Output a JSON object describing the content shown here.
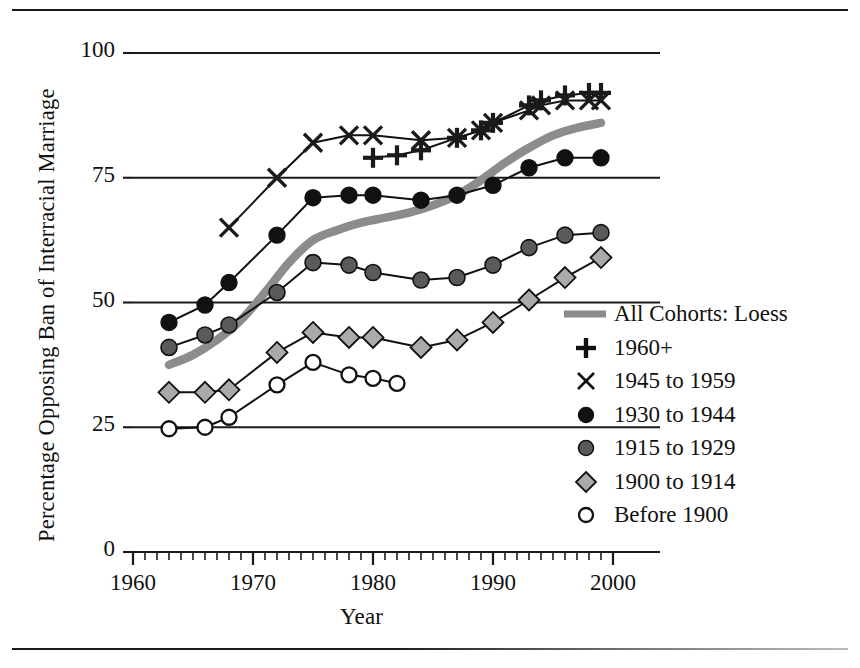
{
  "chart_data": {
    "type": "line",
    "title": "",
    "xlabel": "Year",
    "ylabel": "Percentage Opposing Ban of Interracial Marriage",
    "xlim": [
      1960,
      2000
    ],
    "ylim": [
      0,
      100
    ],
    "xticks": [
      1960,
      1970,
      1980,
      1990,
      2000
    ],
    "yticks": [
      0,
      25,
      50,
      75,
      100
    ],
    "xtick_labels": [
      "1960",
      "1970",
      "1980",
      "1990",
      "2000"
    ],
    "ytick_labels": [
      "0",
      "25",
      "50",
      "75",
      "100"
    ],
    "grid": "horizontal-gridlines-at-25-50-75-100",
    "minor_ticks": "every 1 year on x-axis",
    "legend_position": "right-middle",
    "series": [
      {
        "name": "All Cohorts: Loess",
        "marker": "thick-gray-line",
        "color": "#8c8c8c",
        "x": [
          1963,
          1965,
          1967,
          1969,
          1971,
          1973,
          1975,
          1977,
          1979,
          1981,
          1983,
          1985,
          1987,
          1989,
          1991,
          1993,
          1995,
          1997,
          1999
        ],
        "values": [
          37.5,
          39.5,
          42.5,
          46.5,
          52.0,
          58.0,
          62.5,
          64.5,
          66.0,
          67.0,
          68.0,
          69.5,
          71.5,
          74.5,
          78.0,
          81.0,
          83.5,
          85.0,
          86.0
        ]
      },
      {
        "name": "1960+",
        "marker": "plus",
        "color": "#111111",
        "x": [
          1980,
          1982,
          1984,
          1987,
          1989,
          1990,
          1993,
          1994,
          1996,
          1998,
          1999
        ],
        "values": [
          79.0,
          79.5,
          80.5,
          83.0,
          84.5,
          86.0,
          89.5,
          90.5,
          91.5,
          92.0,
          92.0
        ]
      },
      {
        "name": "1945 to 1959",
        "marker": "cross",
        "color": "#111111",
        "x": [
          1968,
          1972,
          1975,
          1978,
          1980,
          1984,
          1987,
          1989,
          1990,
          1993,
          1994,
          1996,
          1998,
          1999
        ],
        "values": [
          65.0,
          75.0,
          82.0,
          83.5,
          83.5,
          82.5,
          83.0,
          84.5,
          86.0,
          88.5,
          89.5,
          90.5,
          90.5,
          90.5
        ]
      },
      {
        "name": "1930 to 1944",
        "marker": "filled-circle",
        "color": "#111111",
        "x": [
          1963,
          1966,
          1968,
          1972,
          1975,
          1978,
          1980,
          1984,
          1987,
          1990,
          1993,
          1996,
          1999
        ],
        "values": [
          46.0,
          49.5,
          54.0,
          63.5,
          71.0,
          71.5,
          71.5,
          70.5,
          71.5,
          73.5,
          77.0,
          79.0,
          79.0
        ]
      },
      {
        "name": "1915 to 1929",
        "marker": "gray-circle",
        "color": "#5a5a5a",
        "x": [
          1963,
          1966,
          1968,
          1972,
          1975,
          1978,
          1980,
          1984,
          1987,
          1990,
          1993,
          1996,
          1999
        ],
        "values": [
          41.0,
          43.5,
          45.5,
          52.0,
          58.0,
          57.5,
          56.0,
          54.5,
          55.0,
          57.5,
          61.0,
          63.5,
          64.0
        ]
      },
      {
        "name": "1900 to 1914",
        "marker": "diamond",
        "color": "#aaaaaa",
        "x": [
          1963,
          1966,
          1968,
          1972,
          1975,
          1978,
          1980,
          1984,
          1987,
          1990,
          1993,
          1996,
          1999
        ],
        "values": [
          32.0,
          32.0,
          32.5,
          40.0,
          44.0,
          43.0,
          43.0,
          41.0,
          42.5,
          46.0,
          50.5,
          55.0,
          59.0
        ]
      },
      {
        "name": "Before 1900",
        "marker": "open-circle",
        "color": "#ffffff",
        "x": [
          1963,
          1966,
          1968,
          1972,
          1975,
          1978,
          1980,
          1982
        ],
        "values": [
          24.7,
          25.0,
          27.0,
          33.5,
          38.0,
          35.5,
          34.8,
          33.8
        ]
      }
    ]
  },
  "legend": {
    "items": [
      {
        "label": "All Cohorts: Loess",
        "marker": "thick-gray-line"
      },
      {
        "label": "1960+",
        "marker": "plus"
      },
      {
        "label": "1945 to 1959",
        "marker": "cross"
      },
      {
        "label": "1930 to 1944",
        "marker": "filled-circle"
      },
      {
        "label": "1915 to 1929",
        "marker": "gray-circle"
      },
      {
        "label": "1900 to 1914",
        "marker": "diamond"
      },
      {
        "label": "Before 1900",
        "marker": "open-circle"
      }
    ]
  },
  "colors": {
    "axis": "#1a1a1a",
    "loess": "#8c8c8c",
    "dark_circle": "#111111",
    "gray_circle": "#5a5a5a",
    "diamond": "#aaaaaa",
    "open_circle": "#ffffff",
    "background": "#ffffff"
  }
}
